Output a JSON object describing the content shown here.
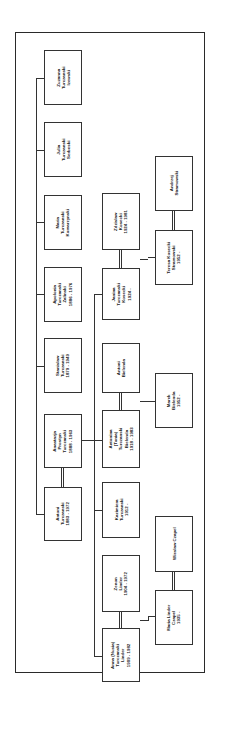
{
  "diagram": {
    "type": "family-tree",
    "orientation": "rotated-90-ccw",
    "generation_1": [
      {
        "name": "Zuzanna",
        "surname": "Turczanski",
        "married": "Izewski",
        "dates": ""
      },
      {
        "name": "Julia",
        "surname": "Turczanski",
        "married": "Serbeski",
        "dates": ""
      },
      {
        "name": "Maria",
        "surname": "Turczanski",
        "married": "Komarzynski",
        "dates": ""
      },
      {
        "name": "Apolonia",
        "surname": "Turczanski",
        "married": "Zalinski",
        "dates": "1886 - 1976"
      },
      {
        "name": "Stanislaw",
        "surname": "Turczanski",
        "married": "",
        "dates": "1879 - 1949"
      },
      {
        "name": "Anastazja",
        "surname": "Prostyn",
        "married": "Turczanski",
        "dates": "1888 - 1963"
      },
      {
        "name": "Antoni",
        "surname": "Turczanski",
        "married": "",
        "dates": "1883 - 1972"
      }
    ],
    "generation_2": [
      {
        "name": "Zdzislaw",
        "surname": "Kosecki",
        "married": "",
        "dates": "1924 - 1981"
      },
      {
        "name": "Janina",
        "surname": "Turczanski",
        "married": "Kosecki",
        "dates": "1924 -"
      },
      {
        "name": "Antoni",
        "surname": "Bielenda",
        "married": "",
        "dates": ""
      },
      {
        "name": "Antonina",
        "nickname": "(Tonia)",
        "surname": "Turczanski",
        "married": "Bielenda",
        "dates": "1918 - 1983"
      },
      {
        "name": "Kazimiera",
        "surname": "Turczanski",
        "married": "",
        "dates": "1912 -"
      },
      {
        "name": "Zenon",
        "surname": "Linder",
        "married": "",
        "dates": "1904 - 1972"
      },
      {
        "name": "Anna (Nusia)",
        "surname": "Turczanski",
        "married": "Linder",
        "dates": "1909 - 1982"
      }
    ],
    "generation_3": [
      {
        "name": "Andrzej",
        "surname": "Stramowski",
        "married": "",
        "dates": ""
      },
      {
        "name": "Teresa Kosecki",
        "surname": "Stramowski",
        "married": "",
        "dates": "1952 -"
      },
      {
        "name": "Marek",
        "surname": "Bielenda",
        "married": "",
        "dates": "1952 -"
      },
      {
        "name": "Wieslaw Czapel",
        "surname": "",
        "married": "",
        "dates": ""
      },
      {
        "name": "Maria Linder",
        "surname": "Czapel",
        "married": "",
        "dates": "1935 -"
      }
    ],
    "colors": {
      "line": "#333333",
      "background": "#ffffff",
      "text": "#222222"
    }
  }
}
